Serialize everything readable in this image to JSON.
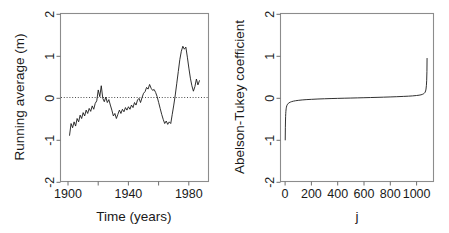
{
  "figure": {
    "background": "#ffffff",
    "line_color": "#1a1a1a",
    "frame_color": "#8c8c8c",
    "panel_count": 2
  },
  "chart_data": [
    {
      "id": "left-panel",
      "type": "line",
      "title": "",
      "xlabel": "Time (years)",
      "ylabel": "Running average (m)",
      "xlim": [
        1895,
        1993
      ],
      "ylim": [
        -2,
        2
      ],
      "grid": false,
      "legend": null,
      "xticks": [
        1900,
        1920,
        1940,
        1960,
        1980
      ],
      "xticklabels": [
        "1900",
        "",
        "1940",
        "",
        "1980"
      ],
      "yticks": [
        -2,
        -1,
        0,
        1,
        2
      ],
      "yticklabels": [
        "-2",
        "-1",
        "0",
        "1",
        "2"
      ],
      "annotations": [
        {
          "kind": "horizontal-dotted-reference-line",
          "y": 0
        }
      ],
      "x": [
        1901,
        1902,
        1903,
        1904,
        1905,
        1906,
        1907,
        1908,
        1909,
        1910,
        1911,
        1912,
        1913,
        1914,
        1915,
        1916,
        1917,
        1918,
        1919,
        1920,
        1921,
        1922,
        1923,
        1924,
        1925,
        1926,
        1927,
        1928,
        1929,
        1930,
        1931,
        1932,
        1933,
        1934,
        1935,
        1936,
        1937,
        1938,
        1939,
        1940,
        1941,
        1942,
        1943,
        1944,
        1945,
        1946,
        1947,
        1948,
        1949,
        1950,
        1951,
        1952,
        1953,
        1954,
        1955,
        1956,
        1957,
        1958,
        1959,
        1960,
        1961,
        1962,
        1963,
        1964,
        1965,
        1966,
        1967,
        1968,
        1969,
        1970,
        1971,
        1972,
        1973,
        1974,
        1975,
        1976,
        1977,
        1978,
        1979,
        1980,
        1981,
        1982,
        1983,
        1984,
        1985,
        1986,
        1987
      ],
      "y": [
        -0.9,
        -0.62,
        -0.72,
        -0.58,
        -0.68,
        -0.5,
        -0.58,
        -0.42,
        -0.5,
        -0.36,
        -0.44,
        -0.3,
        -0.38,
        -0.26,
        -0.33,
        -0.2,
        -0.28,
        -0.14,
        -0.08,
        0.18,
        0.02,
        0.28,
        -0.02,
        -0.1,
        0.01,
        -0.12,
        -0.05,
        -0.18,
        -0.3,
        -0.44,
        -0.38,
        -0.5,
        -0.4,
        -0.3,
        -0.38,
        -0.28,
        -0.34,
        -0.24,
        -0.3,
        -0.22,
        -0.28,
        -0.18,
        -0.24,
        -0.12,
        -0.18,
        -0.06,
        -0.02,
        -0.12,
        0.0,
        0.1,
        0.14,
        0.24,
        0.2,
        0.31,
        0.22,
        0.17,
        0.19,
        0.12,
        0.02,
        -0.12,
        -0.26,
        -0.4,
        -0.52,
        -0.62,
        -0.56,
        -0.64,
        -0.58,
        -0.62,
        -0.4,
        -0.18,
        0.06,
        0.34,
        0.62,
        0.9,
        1.1,
        1.22,
        1.15,
        1.2,
        0.96,
        0.7,
        0.46,
        0.28,
        0.15,
        0.26,
        0.44,
        0.3,
        0.4,
        0.17
      ]
    },
    {
      "id": "right-panel",
      "type": "line",
      "title": "",
      "xlabel": "j",
      "ylabel": "Abelson-Tukey coefficient",
      "xlim": [
        -35,
        1130
      ],
      "ylim": [
        -2,
        2
      ],
      "grid": false,
      "legend": null,
      "xticks": [
        0,
        200,
        400,
        600,
        800,
        1000
      ],
      "xticklabels": [
        "0",
        "200",
        "400",
        "600",
        "800",
        "1000"
      ],
      "yticks": [
        -2,
        -1,
        0,
        1,
        2
      ],
      "yticklabels": [
        "-2",
        "-1",
        "0",
        "1",
        "2"
      ],
      "annotations": [],
      "x": [
        1,
        2,
        3,
        4,
        5,
        6,
        8,
        10,
        13,
        16,
        20,
        25,
        30,
        40,
        50,
        65,
        80,
        100,
        130,
        160,
        200,
        250,
        300,
        350,
        400,
        450,
        500,
        550,
        600,
        650,
        700,
        750,
        800,
        850,
        900,
        940,
        970,
        1000,
        1020,
        1035,
        1045,
        1053,
        1060,
        1065,
        1070,
        1073,
        1076,
        1078,
        1080,
        1081
      ],
      "y": [
        -1.01,
        -0.72,
        -0.56,
        -0.45,
        -0.38,
        -0.33,
        -0.27,
        -0.23,
        -0.195,
        -0.175,
        -0.155,
        -0.138,
        -0.126,
        -0.11,
        -0.098,
        -0.086,
        -0.077,
        -0.068,
        -0.058,
        -0.051,
        -0.044,
        -0.036,
        -0.03,
        -0.025,
        -0.021,
        -0.017,
        -0.013,
        -0.009,
        -0.005,
        -0.001,
        0.003,
        0.008,
        0.013,
        0.019,
        0.026,
        0.032,
        0.038,
        0.047,
        0.055,
        0.064,
        0.074,
        0.086,
        0.102,
        0.12,
        0.155,
        0.2,
        0.29,
        0.4,
        0.62,
        0.93
      ]
    }
  ]
}
